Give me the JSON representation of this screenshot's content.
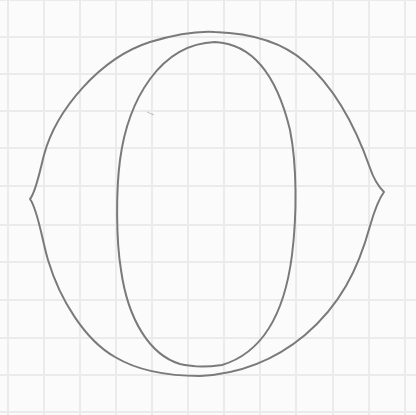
{
  "image": {
    "description": "Pencil sketch of a letter-O shape on grid paper",
    "width": 416,
    "height": 415
  },
  "paper": {
    "background_color": "#fbfbfb",
    "grid_color": "#ebebeb",
    "grid_x": [
      8,
      44,
      80,
      116,
      152,
      188,
      224,
      260,
      296,
      333,
      369,
      405
    ],
    "grid_y": [
      0,
      37,
      74,
      111,
      148,
      186,
      225,
      262,
      300,
      338,
      375,
      412
    ]
  },
  "drawing": {
    "stroke_color": "#7a7a7a",
    "outer_shape": {
      "label": "outer contour",
      "path": "M30,199 C36,192 40,170 44,155 C56,110 100,58 150,42 C180,33 200,31 215,32 C245,33 280,40 305,62 C335,88 355,125 370,168 C374,180 378,186 384,192 C378,200 374,212 370,226 C358,270 340,305 305,335 C275,360 240,374 200,376 C170,376 140,372 115,357 C85,340 60,300 48,260 C42,240 38,210 30,199 Z"
    },
    "inner_shape": {
      "label": "inner oval",
      "path": "M215,42 C255,44 278,80 290,130 C297,165 297,215 292,255 C285,310 265,352 222,365 C200,368 190,366 180,364 C150,355 128,320 121,270 C116,240 116,190 120,160 C128,100 160,44 215,42 Z"
    },
    "stray_mark": {
      "x1": 147,
      "y1": 112,
      "x2": 154,
      "y2": 115
    }
  }
}
